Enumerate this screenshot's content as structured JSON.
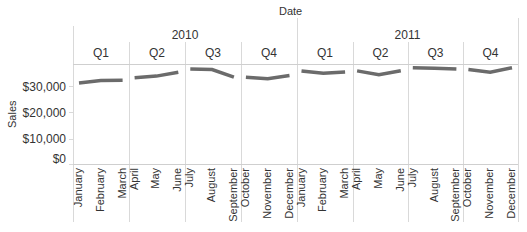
{
  "header": {
    "title": "Date"
  },
  "axes": {
    "ylabel": "Sales",
    "yticks": [
      "$30,000",
      "$20,000",
      "$10,000",
      "$0"
    ]
  },
  "years": [
    "2010",
    "2011"
  ],
  "quarters": [
    "Q1",
    "Q2",
    "Q3",
    "Q4",
    "Q1",
    "Q2",
    "Q3",
    "Q4"
  ],
  "months": [
    "January",
    "February",
    "March",
    "April",
    "May",
    "June",
    "July",
    "August",
    "September",
    "October",
    "November",
    "December",
    "January",
    "February",
    "March",
    "April",
    "May",
    "June",
    "July",
    "August",
    "September",
    "October",
    "November",
    "December"
  ],
  "colors": {
    "line": "#6b6b6b",
    "grid": "#d9d9d9"
  },
  "chart_data": {
    "type": "line",
    "title": "Date",
    "xlabel": "Date",
    "ylabel": "Sales",
    "ylim": [
      0,
      38500
    ],
    "grid": true,
    "legend": "none",
    "x": [
      "2010 January",
      "2010 February",
      "2010 March",
      "2010 April",
      "2010 May",
      "2010 June",
      "2010 July",
      "2010 August",
      "2010 September",
      "2010 October",
      "2010 November",
      "2010 December",
      "2011 January",
      "2011 February",
      "2011 March",
      "2011 April",
      "2011 May",
      "2011 June",
      "2011 July",
      "2011 August",
      "2011 September",
      "2011 October",
      "2011 November",
      "2011 December"
    ],
    "series": [
      {
        "name": "Sales",
        "values": [
          31200,
          32100,
          32200,
          33200,
          33800,
          35300,
          36500,
          36300,
          33400,
          33400,
          32800,
          34000,
          35800,
          34900,
          35400,
          35800,
          34300,
          35900,
          37000,
          36800,
          36500,
          36300,
          35300,
          37000
        ]
      }
    ],
    "groups": {
      "years": [
        "2010",
        "2011"
      ],
      "quarters": [
        "Q1",
        "Q2",
        "Q3",
        "Q4"
      ]
    }
  }
}
